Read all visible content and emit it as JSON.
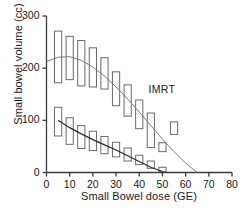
{
  "chart_data": {
    "type": "box",
    "title": "",
    "xlabel": "Small Bowel dose (GE)",
    "ylabel": "Small bowel volume (cc)",
    "xlim": [
      0,
      80
    ],
    "ylim": [
      0,
      300
    ],
    "xticks": [
      0,
      10,
      20,
      30,
      40,
      50,
      60,
      70,
      80
    ],
    "yticks": [
      0,
      100,
      200,
      300
    ],
    "grid": false,
    "legend": "none",
    "annotations": [
      {
        "text": "IMRT",
        "x": 44,
        "y": 160
      }
    ],
    "series": [
      {
        "name": "upper-series",
        "kind": "box-with-fit-curve",
        "x": [
          5,
          10,
          15,
          20,
          25,
          30,
          35,
          40,
          45,
          50,
          55
        ],
        "box_low": [
          172,
          178,
          166,
          164,
          160,
          128,
          108,
          84,
          48,
          40,
          73
        ],
        "box_high": [
          271,
          261,
          253,
          239,
          220,
          193,
          168,
          139,
          114,
          57,
          97
        ],
        "fit_curve_x": [
          0,
          5,
          10,
          15,
          20,
          25,
          30,
          35,
          40,
          45,
          50,
          55,
          60,
          65
        ],
        "fit_curve_y": [
          213,
          221,
          222,
          215,
          202,
          185,
          164,
          141,
          116,
          90,
          64,
          40,
          18,
          0
        ]
      },
      {
        "name": "lower-series",
        "kind": "box-with-fit-curve",
        "x": [
          5,
          10,
          15,
          20,
          25,
          30,
          35,
          40,
          45,
          50
        ],
        "box_low": [
          70,
          54,
          46,
          42,
          36,
          30,
          22,
          15,
          8,
          2
        ],
        "box_high": [
          125,
          105,
          90,
          79,
          69,
          58,
          47,
          33,
          22,
          10
        ],
        "fit_curve_x": [
          5,
          10,
          15,
          20,
          25,
          30,
          35,
          40,
          45,
          50
        ],
        "fit_curve_y": [
          100,
          86,
          74,
          63,
          53,
          43,
          32,
          21,
          10,
          2
        ]
      }
    ]
  },
  "axis": {
    "x_tick_labels": [
      "0",
      "10",
      "20",
      "30",
      "40",
      "50",
      "60",
      "70",
      "80"
    ],
    "y_tick_labels": [
      "0",
      "100",
      "200",
      "300"
    ],
    "x_title": "Small Bowel dose (GE)",
    "y_title": "Small bowel volume (cc)"
  },
  "annotation": {
    "imrt_label": "IMRT"
  }
}
